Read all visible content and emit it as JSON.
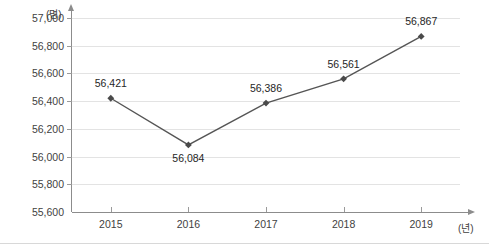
{
  "chart_data": {
    "type": "line",
    "title": "",
    "subtitle": "",
    "xlabel": "(년)",
    "ylabel": "(명)",
    "categories": [
      "2015",
      "2016",
      "2017",
      "2018",
      "2019"
    ],
    "values": [
      56421,
      56084,
      56386,
      56561,
      56867
    ],
    "value_labels": [
      "56,421",
      "56,084",
      "56,386",
      "56,561",
      "56,867"
    ],
    "label_positions": [
      "above",
      "below",
      "above",
      "above",
      "above"
    ],
    "series": [
      {
        "name": "",
        "values": [
          56421,
          56084,
          56386,
          56561,
          56867
        ]
      }
    ],
    "ylim": [
      55600,
      57000
    ],
    "ytick_values": [
      55600,
      55800,
      56000,
      56200,
      56400,
      56600,
      56800,
      57000
    ],
    "ytick_labels": [
      "55,600",
      "55,800",
      "56,000",
      "56,200",
      "56,400",
      "56,600",
      "56,800",
      "57,000"
    ],
    "grid": true,
    "grid_axis": "y",
    "legend": false,
    "legend_position": "none",
    "marker": "diamond",
    "colors": {
      "line": "#555555",
      "marker": "#4a4a4a",
      "grid": "#e3e3e3",
      "axis": "#8c8c8c",
      "text": "#3f3f3f",
      "label_text": "#262626",
      "background": "#ffffff"
    }
  }
}
